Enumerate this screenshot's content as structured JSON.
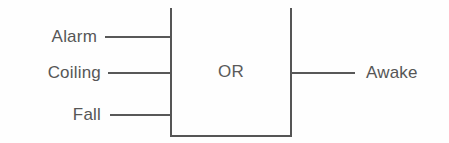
{
  "diagram": {
    "gate": {
      "label": "OR",
      "shape": "rectangle-open-top"
    },
    "inputs": [
      {
        "label": "Alarm",
        "wire": "input-wire-alarm"
      },
      {
        "label": "Coiling",
        "wire": "input-wire-coiling"
      },
      {
        "label": "Fall",
        "wire": "input-wire-fall"
      }
    ],
    "outputs": [
      {
        "label": "Awake",
        "wire": "output-wire-awake"
      }
    ],
    "colors": {
      "background": "#fefefe",
      "stroke": "#555555",
      "text": "#565656"
    }
  }
}
